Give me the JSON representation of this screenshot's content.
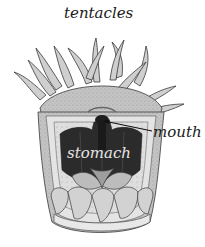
{
  "diagram": {
    "labels": {
      "tentacles": "tentacles",
      "mouth": "mouth",
      "stomach": "stomach"
    },
    "colors": {
      "background": "#ffffff",
      "tissue_light": "#d9d9d9",
      "tissue_mid": "#a8a8a8",
      "stomach_dark": "#2b2b2b",
      "outline": "#3a3a3a",
      "label_text": "#1a1a1a",
      "stomach_label_text": "#e6e6e6"
    }
  }
}
